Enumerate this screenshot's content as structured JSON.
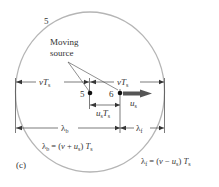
{
  "diagram": {
    "wavefront_label": "5",
    "callout": {
      "line1": "Moving",
      "line2": "source"
    },
    "left_distance": {
      "main": "v",
      "T": "T",
      "sub": "s"
    },
    "right_distance": {
      "main": "v",
      "T": "T",
      "sub": "s"
    },
    "source_positions": [
      {
        "label": "5"
      },
      {
        "label": "6"
      }
    ],
    "velocity": {
      "main": "u",
      "sub": "s"
    },
    "displacement": {
      "u": "u",
      "usub": "s",
      "T": "T",
      "tsub": "s"
    },
    "lambda_b_label": {
      "lam": "λ",
      "sub": "b"
    },
    "lambda_f_label": {
      "lam": "λ",
      "sub": "f"
    },
    "lambda_b_eq": {
      "lam": "λ",
      "sub": "b",
      "eq": " = (",
      "v": "v",
      "plus": " + ",
      "u": "u",
      "usub": "s",
      "close": ") ",
      "T": "T",
      "tsub": "s"
    },
    "lambda_f_eq": {
      "lam": "λ",
      "sub": "f",
      "eq": " = (",
      "v": "v",
      "minus": " − ",
      "u": "u",
      "usub": "s",
      "close": ") ",
      "T": "T",
      "tsub": "s"
    },
    "panel_label": "(c)",
    "colors": {
      "circle": "#b5b5b5",
      "lines": "#333333",
      "arrow": "#555555"
    }
  }
}
